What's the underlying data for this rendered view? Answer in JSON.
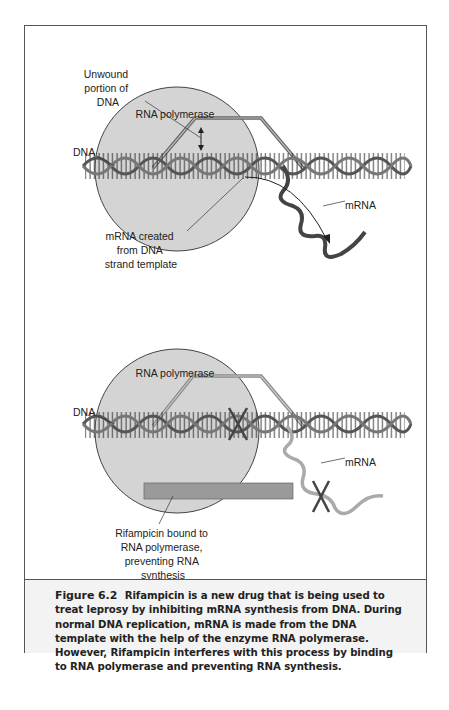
{
  "top_diagram": {
    "polymerase_label": "RNA polymerase",
    "dna_label": "DNA",
    "unwound_label": [
      "Unwound",
      "portion of",
      "DNA"
    ],
    "mrna_label": "mRNA",
    "mrna_created_label": [
      "mRNA created",
      "from DNA",
      "strand template"
    ]
  },
  "bottom_diagram": {
    "polymerase_label": "RNA polymerase",
    "dna_label": "DNA",
    "mrna_label": "mRNA",
    "rifampicin_label": [
      "Rifampicin bound to",
      "RNA polymerase,",
      "preventing RNA",
      "synthesis"
    ]
  },
  "caption": {
    "figure_number": "Figure 6.2",
    "text": "Rifampicin is a new drug that is being used to treat leprosy by inhibiting mRNA synthesis from DNA. During normal DNA replication, mRNA is made from the DNA template with the help of the enzyme RNA polymerase. However, Rifampicin interferes with this process by binding to RNA polymerase and preventing RNA synthesis."
  },
  "colors": {
    "polymerase_fill": "#d4d4d4",
    "rifampicin_bar": "#9a9a9a",
    "dna_strand": "#555555",
    "mrna_dark": "#444444",
    "mrna_light": "#aaaaaa",
    "border": "#555555"
  }
}
